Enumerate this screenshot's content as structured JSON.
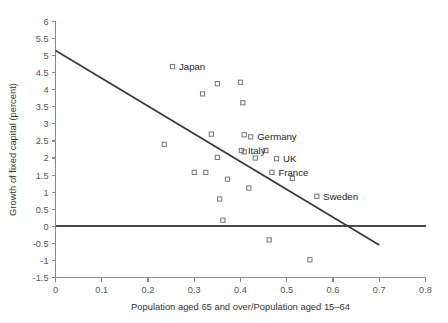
{
  "chart_data": {
    "type": "scatter",
    "title": "",
    "xlabel": "Population aged 65 and over/Population aged 15–64",
    "ylabel": "Growth of fixed capital (percent)",
    "xlim": [
      0,
      0.8
    ],
    "ylim": [
      -1.5,
      6
    ],
    "xticks": [
      "0",
      "0.1",
      "0.2",
      "0.3",
      "0.4",
      "0.5",
      "0.6",
      "0.7",
      "0.8"
    ],
    "xtick_values": [
      0,
      0.1,
      0.2,
      0.3,
      0.4,
      0.5,
      0.6,
      0.7,
      0.8
    ],
    "yticks": [
      "6",
      "5.5",
      "5",
      "4.5",
      "4",
      "3.5",
      "3",
      "2.5",
      "2",
      "1.5",
      "1",
      "0.5",
      "0",
      "-0.5",
      "-1",
      "-1.5"
    ],
    "ytick_values": [
      6,
      5.5,
      5,
      4.5,
      4,
      3.5,
      3,
      2.5,
      2,
      1.5,
      1,
      0.5,
      0,
      -0.5,
      -1,
      -1.5
    ],
    "grid": false,
    "legend": "none",
    "marker": "open-square",
    "points": [
      {
        "x": 0.235,
        "y": 2.4,
        "label": ""
      },
      {
        "x": 0.253,
        "y": 4.68,
        "label": "Japan"
      },
      {
        "x": 0.3,
        "y": 1.58,
        "label": ""
      },
      {
        "x": 0.318,
        "y": 3.88,
        "label": ""
      },
      {
        "x": 0.325,
        "y": 1.58,
        "label": ""
      },
      {
        "x": 0.337,
        "y": 2.7,
        "label": ""
      },
      {
        "x": 0.35,
        "y": 4.18,
        "label": ""
      },
      {
        "x": 0.355,
        "y": 0.8,
        "label": ""
      },
      {
        "x": 0.35,
        "y": 2.02,
        "label": ""
      },
      {
        "x": 0.362,
        "y": 0.18,
        "label": ""
      },
      {
        "x": 0.372,
        "y": 1.38,
        "label": ""
      },
      {
        "x": 0.4,
        "y": 4.22,
        "label": ""
      },
      {
        "x": 0.405,
        "y": 3.62,
        "label": ""
      },
      {
        "x": 0.408,
        "y": 2.68,
        "label": ""
      },
      {
        "x": 0.408,
        "y": 2.18,
        "label": ""
      },
      {
        "x": 0.418,
        "y": 1.12,
        "label": ""
      },
      {
        "x": 0.422,
        "y": 2.62,
        "label": "Germany"
      },
      {
        "x": 0.432,
        "y": 2.0,
        "label": ""
      },
      {
        "x": 0.402,
        "y": 2.22,
        "label": "Italy"
      },
      {
        "x": 0.455,
        "y": 2.22,
        "label": ""
      },
      {
        "x": 0.462,
        "y": -0.4,
        "label": ""
      },
      {
        "x": 0.468,
        "y": 1.58,
        "label": "France"
      },
      {
        "x": 0.478,
        "y": 1.98,
        "label": "UK"
      },
      {
        "x": 0.512,
        "y": 1.4,
        "label": ""
      },
      {
        "x": 0.55,
        "y": -0.98,
        "label": ""
      },
      {
        "x": 0.565,
        "y": 0.88,
        "label": "Sweden"
      }
    ],
    "trend_line": {
      "x0": 0.0,
      "y0": 5.15,
      "x1": 0.7,
      "y1": -0.55
    },
    "zero_line": {
      "y": 0
    }
  },
  "annotations": {
    "japan": "Japan",
    "germany": "Germany",
    "italy": "Italy",
    "uk": "UK",
    "france": "France",
    "sweden": "Sweden"
  },
  "colors": {
    "marker_stroke": "#7a7a7a",
    "trend": "#3a3a3a",
    "axis": "#8a8a8a",
    "text": "#333333",
    "background": "#ffffff"
  }
}
